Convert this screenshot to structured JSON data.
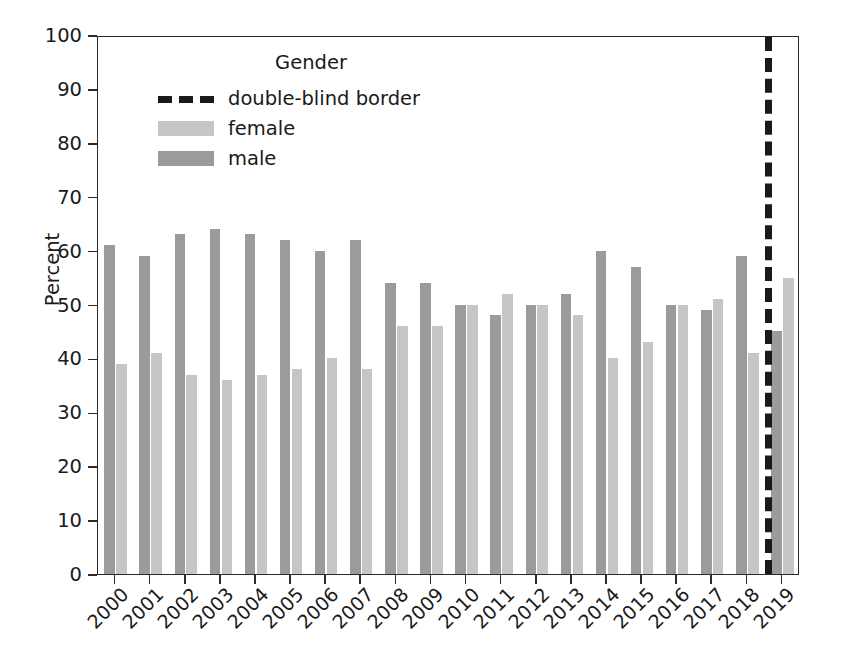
{
  "chart_data": {
    "type": "bar",
    "title": "",
    "xlabel": "",
    "ylabel": "Percent",
    "ylim": [
      0,
      100
    ],
    "ytick_labels": [
      "0",
      "10",
      "20",
      "30",
      "40",
      "50",
      "60",
      "70",
      "80",
      "90",
      "100"
    ],
    "ytick_values": [
      0,
      10,
      20,
      30,
      40,
      50,
      60,
      70,
      80,
      90,
      100
    ],
    "grid": false,
    "legend": {
      "title": "Gender",
      "position": "upper left (inside axes)",
      "entries": [
        {
          "label": "double-blind border",
          "style": "dashed-line",
          "color": "#1a1a1a"
        },
        {
          "label": "female",
          "style": "bar-swatch",
          "color": "#c6c6c6"
        },
        {
          "label": "male",
          "style": "bar-swatch",
          "color": "#9b9b9b"
        }
      ]
    },
    "categories": [
      "2000",
      "2001",
      "2002",
      "2003",
      "2004",
      "2005",
      "2006",
      "2007",
      "2008",
      "2009",
      "2010",
      "2011",
      "2012",
      "2013",
      "2014",
      "2015",
      "2016",
      "2017",
      "2018",
      "2019"
    ],
    "series": [
      {
        "name": "male",
        "color": "#9b9b9b",
        "values": [
          61,
          59,
          63,
          64,
          63,
          62,
          60,
          62,
          54,
          54,
          50,
          48,
          50,
          52,
          60,
          57,
          50,
          49,
          59,
          45
        ]
      },
      {
        "name": "female",
        "color": "#c6c6c6",
        "values": [
          39,
          41,
          37,
          36,
          37,
          38,
          40,
          38,
          46,
          46,
          50,
          52,
          50,
          48,
          40,
          43,
          50,
          51,
          41,
          55
        ]
      }
    ],
    "annotations": [
      {
        "type": "vline",
        "label": "double-blind border",
        "between": [
          "2018",
          "2019"
        ],
        "x_category_index": 18.5,
        "style": "dashed",
        "color": "#1a1a1a",
        "linewidth": 7
      }
    ]
  }
}
